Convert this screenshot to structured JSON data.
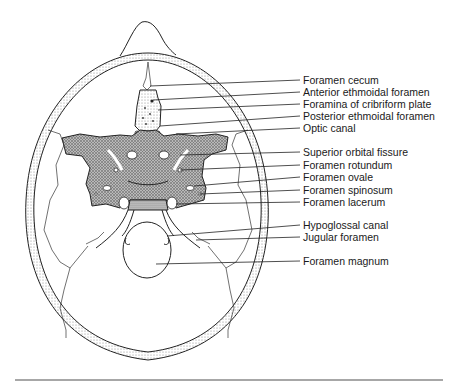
{
  "figure": {
    "type": "anatomical-diagram",
    "labels": [
      {
        "text": "Foramen cecum",
        "y": 80,
        "target": [
          220,
          86
        ]
      },
      {
        "text": "Anterior ethmoidal foramen",
        "y": 93,
        "target": [
          153,
          100
        ]
      },
      {
        "text": "Foramina of cribriform plate",
        "y": 104,
        "target": [
          158,
          110
        ]
      },
      {
        "text": "Posterior ethmoidal foramen",
        "y": 116,
        "target": [
          162,
          128
        ]
      },
      {
        "text": "Optic canal",
        "y": 129,
        "target": [
          175,
          142
        ]
      },
      {
        "text": "Superior orbital fissure",
        "y": 153,
        "target": [
          183,
          160
        ]
      },
      {
        "text": "Foramen rotundum",
        "y": 166,
        "target": [
          176,
          175
        ]
      },
      {
        "text": "Foramen ovale",
        "y": 178,
        "target": [
          200,
          183
        ]
      },
      {
        "text": "Foramen spinosum",
        "y": 191,
        "target": [
          205,
          190
        ]
      },
      {
        "text": "Foramen lacerum",
        "y": 203,
        "target": [
          172,
          203
        ]
      },
      {
        "text": "Hypoglossal canal",
        "y": 226,
        "target": [
          173,
          231
        ]
      },
      {
        "text": "Jugular foramen",
        "y": 238,
        "target": [
          196,
          240
        ]
      },
      {
        "text": "Foramen magnum",
        "y": 262,
        "target": [
          154,
          264
        ]
      }
    ],
    "colors": {
      "line": "#222222",
      "bone_fill": "#9a9a9a",
      "rule": "#8a8a8a"
    }
  }
}
